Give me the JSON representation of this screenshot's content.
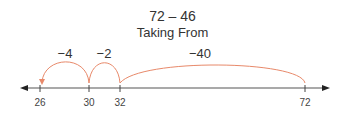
{
  "title": "72 – 46",
  "subtitle": "Taking From",
  "colors": {
    "arc": "#e8896a",
    "axis": "#555555",
    "text": "#333333"
  },
  "number_line": {
    "ticks": [
      {
        "value": "26",
        "x": 40
      },
      {
        "value": "30",
        "x": 89
      },
      {
        "value": "32",
        "x": 120
      },
      {
        "value": "72",
        "x": 305
      }
    ]
  },
  "jumps": [
    {
      "label": "−40",
      "from": 72,
      "to": 32,
      "label_x": 200
    },
    {
      "label": "−2",
      "from": 32,
      "to": 30,
      "label_x": 104
    },
    {
      "label": "−4",
      "from": 30,
      "to": 26,
      "label_x": 65
    }
  ]
}
